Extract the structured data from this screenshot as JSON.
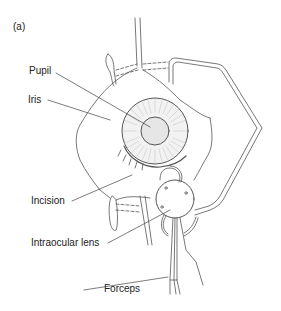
{
  "figure": {
    "panel_label": "(a)",
    "labels": [
      {
        "id": "pupil",
        "text": "Pupil"
      },
      {
        "id": "iris",
        "text": "Iris"
      },
      {
        "id": "incision",
        "text": "Incision"
      },
      {
        "id": "intraocular_lens",
        "text": "Intraocular lens"
      },
      {
        "id": "forceps",
        "text": "Forceps"
      }
    ],
    "colors": {
      "line": "#555555",
      "pupil_fill": "#e6e6e6",
      "iris_fill": "#f2f2f2",
      "background": "#ffffff"
    }
  }
}
